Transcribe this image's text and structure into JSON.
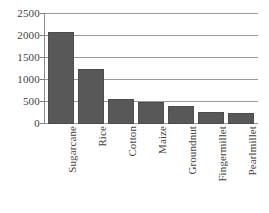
{
  "chart_data": {
    "type": "bar",
    "title": "",
    "subtitle": "",
    "xlabel": "",
    "ylabel": "",
    "categories": [
      "Sugarcane",
      "Rice",
      "Cotton",
      "Maize",
      "Groundnut",
      "Fingermillet",
      "Pearlmillet"
    ],
    "values": [
      2100,
      1250,
      570,
      490,
      400,
      270,
      255
    ],
    "ylim": [
      0,
      2500
    ],
    "yticks": [
      0,
      500,
      1000,
      1500,
      2000,
      2500
    ],
    "ytick_labels": [
      "0",
      "500",
      "1000",
      "1500",
      "2000",
      "2500"
    ],
    "grid": true,
    "grid_axis": "y",
    "legend": false,
    "legend_position": "none",
    "series": [
      {
        "name": "",
        "values": [
          2100,
          1250,
          570,
          490,
          400,
          270,
          255
        ]
      }
    ],
    "colors": {
      "bar": "#585858",
      "bar_edge": "#4c4c4c",
      "gridline": "#9a9a9a",
      "axis": "#8a8a8a",
      "text": "#3f3f3f",
      "background": "#ffffff"
    }
  }
}
